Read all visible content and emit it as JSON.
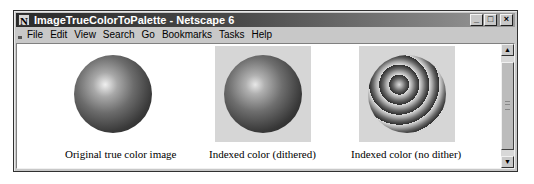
{
  "window": {
    "title": "ImageTrueColorToPalette - Netscape 6",
    "app_icon": "N",
    "controls": {
      "minimize": "_",
      "maximize": "□",
      "close": "×"
    }
  },
  "menubar": {
    "items": [
      {
        "label": "File",
        "accel": "F"
      },
      {
        "label": "Edit",
        "accel": "E"
      },
      {
        "label": "View",
        "accel": "V"
      },
      {
        "label": "Search",
        "accel": "S"
      },
      {
        "label": "Go",
        "accel": "G"
      },
      {
        "label": "Bookmarks",
        "accel": "B"
      },
      {
        "label": "Tasks",
        "accel": "T"
      },
      {
        "label": "Help",
        "accel": "H"
      }
    ]
  },
  "figures": [
    {
      "caption": "Original true color image",
      "style": "original"
    },
    {
      "caption": "Indexed color (dithered)",
      "style": "dithered"
    },
    {
      "caption": "Indexed color (no dither)",
      "style": "nodither"
    }
  ],
  "scrollbar": {
    "up": "▲",
    "down": "▼"
  }
}
